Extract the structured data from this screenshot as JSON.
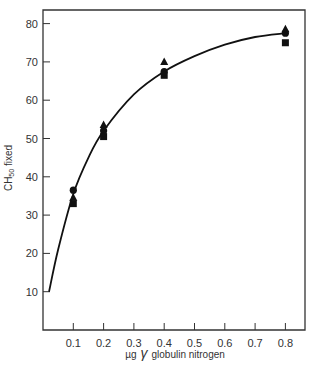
{
  "chart_data": {
    "type": "scatter",
    "title": "",
    "xlabel": "µg γ globulin nitrogen",
    "ylabel": "CH50 fixed",
    "ylabel_main": "CH",
    "ylabel_sub": "50",
    "ylabel_rest": " fixed",
    "xlabel_mu": "µg",
    "xlabel_gamma": "γ",
    "xlabel_rest": "globulin nitrogen",
    "xlim": [
      0,
      0.88
    ],
    "ylim": [
      0,
      85
    ],
    "x_ticks": [
      0.1,
      0.2,
      0.3,
      0.4,
      0.5,
      0.6,
      0.7,
      0.8
    ],
    "x_tick_labels": [
      "0.1",
      "0.2",
      "0.3",
      "0.4",
      "0.5",
      "0.6",
      "0.7",
      "0.8"
    ],
    "y_ticks": [
      10,
      20,
      30,
      40,
      50,
      60,
      70,
      80
    ],
    "y_tick_labels": [
      "10",
      "20",
      "30",
      "40",
      "50",
      "60",
      "70",
      "80"
    ],
    "grid": false,
    "legend": null,
    "x": [
      0.1,
      0.2,
      0.4,
      0.8
    ],
    "series": [
      {
        "name": "circle",
        "marker": "circle",
        "values": [
          36.5,
          52,
          67.5,
          77.5
        ]
      },
      {
        "name": "triangle",
        "marker": "triangle",
        "values": [
          34.5,
          53.5,
          70,
          78.5
        ]
      },
      {
        "name": "square",
        "marker": "square",
        "values": [
          33,
          50.5,
          66.5,
          75
        ]
      }
    ],
    "fit_curve": {
      "type": "line",
      "description": "smooth saturating fit curve",
      "x": [
        0.02,
        0.05,
        0.1,
        0.15,
        0.2,
        0.3,
        0.4,
        0.5,
        0.6,
        0.7,
        0.8
      ],
      "y": [
        10,
        21,
        35.5,
        45,
        52,
        61.5,
        67.5,
        71.5,
        74.5,
        76.5,
        77.5
      ]
    }
  }
}
